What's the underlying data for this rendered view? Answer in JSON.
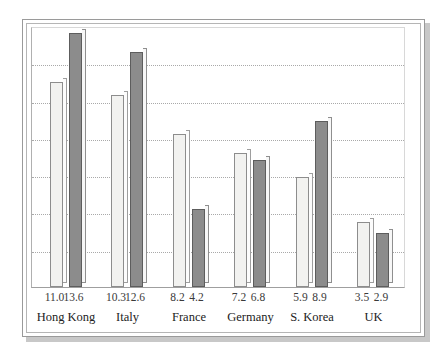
{
  "chart_data": {
    "type": "bar",
    "title": "",
    "xlabel": "",
    "ylabel": "",
    "ylim": [
      0,
      14
    ],
    "grid": true,
    "gridline_values": [
      2,
      4,
      6,
      8,
      10,
      12
    ],
    "legend": "none",
    "categories": [
      "Hong Kong",
      "Italy",
      "France",
      "Germany",
      "S. Korea",
      "UK"
    ],
    "series": [
      {
        "name": "light",
        "color": "#f2f2f0",
        "values": [
          11.0,
          10.3,
          8.2,
          7.2,
          5.9,
          3.5
        ]
      },
      {
        "name": "dark",
        "color": "#8c8c8c",
        "values": [
          13.6,
          12.6,
          4.2,
          6.8,
          8.9,
          2.9
        ]
      }
    ],
    "value_labels": [
      "11.0",
      "13.6",
      "10.3",
      "12.6",
      "8.2",
      "4.2",
      "7.2",
      "6.8",
      "5.9",
      "8.9",
      "3.5",
      "2.9"
    ]
  },
  "colors": {
    "bar_light": "#f2f2f0",
    "bar_dark": "#8c8c8c",
    "gridline": "#a9a9a9",
    "frame": "#9a9a9a",
    "shadow": "#c8c8c8",
    "text": "#222222"
  }
}
